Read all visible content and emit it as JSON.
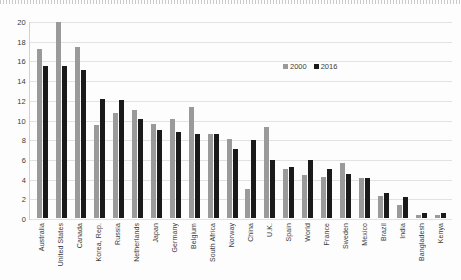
{
  "chart_data": {
    "type": "bar",
    "title": "",
    "xlabel": "",
    "ylabel": "",
    "ylim": [
      0,
      20
    ],
    "ytick_step": 2,
    "yticks": [
      "20",
      "18",
      "16",
      "14",
      "12",
      "10",
      "8",
      "6",
      "4",
      "2",
      "0"
    ],
    "grid": true,
    "legend_position": "top-center-right",
    "categories": [
      "Australia",
      "United States",
      "Canada",
      "Korea, Rep.",
      "Russia",
      "Netherlands",
      "Japan",
      "Germany",
      "Belgium",
      "South Africa",
      "Norway",
      "China",
      "U.K.",
      "Spain",
      "World",
      "France",
      "Sweden",
      "Mexico",
      "Brazil",
      "India",
      "Bangladesh",
      "Kenya"
    ],
    "series": [
      {
        "name": "2000",
        "color": "#9a9a9a",
        "values": [
          17.2,
          20.0,
          17.4,
          9.5,
          10.7,
          11.0,
          9.6,
          10.1,
          11.3,
          8.6,
          8.1,
          3.0,
          9.3,
          5.0,
          4.4,
          4.2,
          5.6,
          4.1,
          2.2,
          1.3,
          0.3,
          0.3
        ]
      },
      {
        "name": "2016",
        "color": "#1a1a1a",
        "values": [
          15.5,
          15.5,
          15.1,
          12.1,
          12.0,
          10.1,
          9.0,
          8.8,
          8.6,
          8.6,
          7.0,
          8.0,
          5.9,
          5.2,
          5.9,
          5.0,
          4.5,
          4.1,
          2.6,
          2.1,
          0.5,
          0.5
        ]
      }
    ]
  },
  "legend": {
    "entries": [
      {
        "label": "2000"
      },
      {
        "label": "2016"
      }
    ]
  }
}
